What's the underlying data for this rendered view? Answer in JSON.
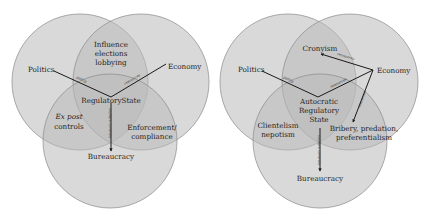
{
  "colors": {
    "background": "#ffffff",
    "circle_fill": "#b9b9b9",
    "circle_opacity": 0.55,
    "circle_stroke": "#8a8a8a",
    "line": "#1a1a1a",
    "text": "#1e1e1e"
  },
  "left_diagram": {
    "circles": [
      {
        "id": "politics",
        "label": "Politics",
        "cx": 80,
        "cy": 82,
        "r": 68
      },
      {
        "id": "economy",
        "label": "Economy",
        "cx": 141,
        "cy": 82,
        "r": 68
      },
      {
        "id": "bureaucracy",
        "label": "Bureaucracy",
        "cx": 110,
        "cy": 141,
        "r": 67
      }
    ],
    "labels": {
      "politics": "Politics",
      "economy": "Economy",
      "bureaucracy": "Bureaucracy",
      "center": "RegulatoryState",
      "top_overlap": [
        "Influence",
        "elections",
        "lobbying"
      ],
      "left_overlap_italic": "Ex post",
      "left_overlap": "controls",
      "right_overlap": [
        "Enforcement/",
        "compliance"
      ]
    },
    "edge_labels": {
      "policy": "policy",
      "resources": "resources",
      "controls": "capture controls"
    }
  },
  "right_diagram": {
    "circles": [
      {
        "id": "politics",
        "label": "Politics",
        "cx": 288,
        "cy": 82,
        "r": 68
      },
      {
        "id": "economy",
        "label": "Economy",
        "cx": 350,
        "cy": 82,
        "r": 68
      },
      {
        "id": "bureaucracy",
        "label": "Bureaucracy",
        "cx": 320,
        "cy": 141,
        "r": 67
      }
    ],
    "labels": {
      "politics": "Politics",
      "economy": "Economy",
      "bureaucracy": "Bureaucracy",
      "center": [
        "Autocratic",
        "Regulatory",
        "State"
      ],
      "top_overlap": "Cronyism",
      "left_overlap": [
        "Clientelism",
        "nepotism"
      ],
      "right_overlap": [
        "Bribery, predation,",
        "preferentialism"
      ]
    },
    "edge_labels": {
      "policy": "policy",
      "resources_center": "resources",
      "resources_cronyism": "resources",
      "resources_bribery": "resources",
      "controls": "capture controls"
    }
  }
}
